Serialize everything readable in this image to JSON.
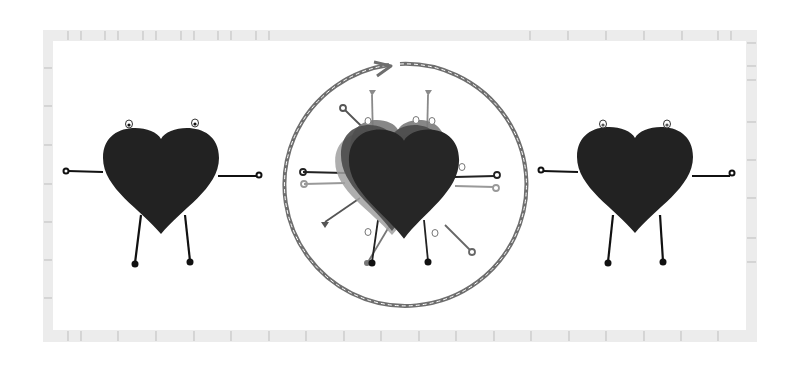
{
  "illustration": {
    "description": "Three heart characters with stick arms and legs; center heart shown as multiple overlapping translucent copies inside a circular dashed arrow indicating rotation/cycle",
    "colors": {
      "background": "#ffffff",
      "frame": "#ececec",
      "frame_tick": "#bdbdbd",
      "heart": "#222222",
      "limb": "#111111",
      "circle_arrow": "#6e6e6e",
      "ghost_heart_1": "#555555",
      "ghost_heart_2": "#7a7a7a",
      "ghost_heart_3": "#999999"
    },
    "characters": [
      {
        "name": "left-heart",
        "position": "left"
      },
      {
        "name": "center-heart-cycle",
        "position": "center"
      },
      {
        "name": "right-heart",
        "position": "right"
      }
    ]
  }
}
